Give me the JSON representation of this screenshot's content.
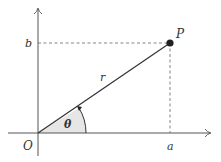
{
  "diagram": {
    "type": "polar-coordinates",
    "labels": {
      "origin": "O",
      "point": "P",
      "radius": "r",
      "angle": "θ",
      "x_value": "a",
      "y_value": "b"
    },
    "colors": {
      "axis": "#555555",
      "line": "#333333",
      "point": "#222222",
      "angle_fill": "#e8e8e8",
      "dashed": "#666666"
    }
  }
}
